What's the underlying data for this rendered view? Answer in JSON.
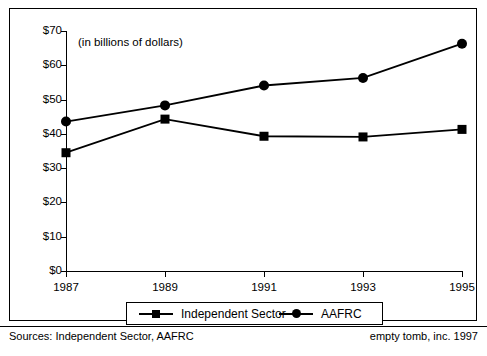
{
  "chart_data": {
    "type": "line",
    "title": "",
    "units_note": "(in billions of dollars)",
    "xlabel": "",
    "ylabel": "",
    "categories": [
      1987,
      1989,
      1991,
      1993,
      1995
    ],
    "x_tick_labels": [
      "1987",
      "1989",
      "1991",
      "1993",
      "1995"
    ],
    "y_tick_labels": [
      "$0",
      "$10",
      "$20",
      "$30",
      "$40",
      "$50",
      "$60",
      "$70"
    ],
    "y_tick_values": [
      0,
      10,
      20,
      30,
      40,
      50,
      60,
      70
    ],
    "ylim": [
      0,
      70
    ],
    "grid": false,
    "legend_position": "bottom",
    "series": [
      {
        "name": "Independent Sector",
        "marker": "square",
        "color": "#000000",
        "values": [
          34.5,
          44.3,
          39.3,
          39.1,
          41.3
        ]
      },
      {
        "name": "AAFRC",
        "marker": "circle",
        "color": "#000000",
        "values": [
          43.6,
          48.3,
          54.1,
          56.3,
          66.3
        ]
      }
    ]
  },
  "legend": {
    "items": [
      {
        "label": "Independent Sector",
        "marker": "square"
      },
      {
        "label": "AAFRC",
        "marker": "circle"
      }
    ]
  },
  "footer": {
    "sources": "Sources: Independent Sector, AAFRC",
    "credit": "empty tomb, inc. 1997"
  }
}
